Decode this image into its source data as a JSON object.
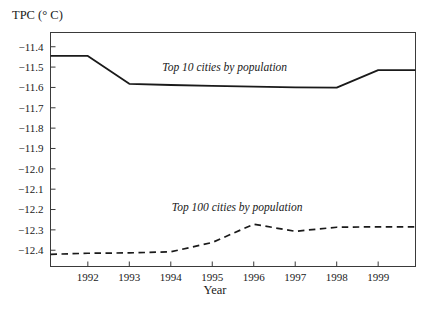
{
  "chart_data": {
    "type": "line",
    "title": "",
    "xlabel": "Year",
    "ylabel": "TPC (° C)",
    "xlim": [
      1991.1,
      1999.9
    ],
    "ylim": [
      -12.48,
      -11.33
    ],
    "grid": false,
    "legend_position": "inline-annotation",
    "x_ticks": [
      "1992",
      "1993",
      "1994",
      "1995",
      "1996",
      "1997",
      "1998",
      "1999"
    ],
    "x_tick_values": [
      1992,
      1993,
      1994,
      1995,
      1996,
      1997,
      1998,
      1999
    ],
    "y_ticks": [
      "−11.4",
      "−11.5",
      "−11.6",
      "−11.7",
      "−11.8",
      "−11.9",
      "−12.0",
      "−12.1",
      "−12.2",
      "−12.3",
      "−12.4"
    ],
    "y_tick_values": [
      -11.4,
      -11.5,
      -11.6,
      -11.7,
      -11.8,
      -11.9,
      -12.0,
      -12.1,
      -12.2,
      -12.3,
      -12.4
    ],
    "series": [
      {
        "name": "Top 10 cities by population",
        "style": "solid",
        "color": "#1a1a1a",
        "annotation_x": 1995.3,
        "annotation_y": -11.52,
        "x": [
          1991.1,
          1992,
          1993,
          1994,
          1995,
          1996,
          1997,
          1998,
          1999,
          1999.9
        ],
        "values": [
          -11.445,
          -11.445,
          -11.582,
          -11.588,
          -11.592,
          -11.596,
          -11.6,
          -11.601,
          -11.515,
          -11.515
        ]
      },
      {
        "name": "Top 100 cities by population",
        "style": "dashed",
        "color": "#1a1a1a",
        "annotation_x": 1995.6,
        "annotation_y": -12.205,
        "x": [
          1991.1,
          1992,
          1993,
          1994,
          1995,
          1996,
          1997,
          1998,
          1999,
          1999.9
        ],
        "values": [
          -12.42,
          -12.415,
          -12.413,
          -12.408,
          -12.362,
          -12.272,
          -12.307,
          -12.287,
          -12.285,
          -12.285
        ]
      }
    ]
  }
}
